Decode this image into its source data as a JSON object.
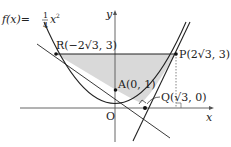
{
  "diagram": {
    "function_label": "f(x)=",
    "function_frac_num": "1",
    "function_frac_den": "4",
    "function_var": "x",
    "function_exp": "2",
    "axis_x_label": "x",
    "axis_y_label": "y",
    "origin_label": "O",
    "points": {
      "R": {
        "label": "R(−2√3, 3)"
      },
      "P": {
        "label": "P(2√3, 3)"
      },
      "A": {
        "label": "A(0, 1)"
      },
      "Q": {
        "label": "Q(√3, 0)"
      }
    },
    "colors": {
      "shade": "#d9d9d9",
      "line": "#222222"
    }
  }
}
